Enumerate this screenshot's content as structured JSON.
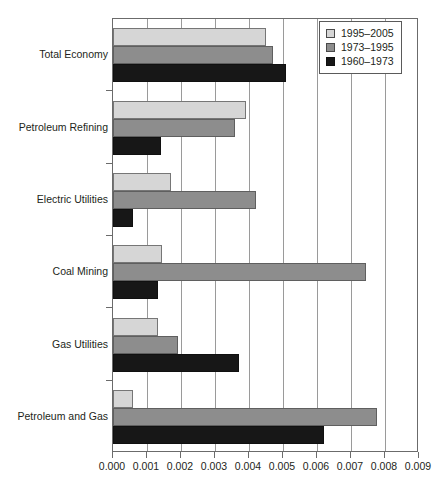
{
  "chart_data": {
    "type": "bar",
    "orientation": "horizontal",
    "title": "",
    "xlabel": "",
    "ylabel": "",
    "xlim": [
      0.0,
      0.009
    ],
    "xticks": [
      "0.000",
      "0.001",
      "0.002",
      "0.003",
      "0.004",
      "0.005",
      "0.006",
      "0.007",
      "0.008",
      "0.009"
    ],
    "xtick_values": [
      0.0,
      0.001,
      0.002,
      0.003,
      0.004,
      0.005,
      0.006,
      0.007,
      0.008,
      0.009
    ],
    "grid": "vertical",
    "legend_position": "top-right",
    "categories": [
      "Total Economy",
      "Petroleum Refining",
      "Electric Utilities",
      "Coal Mining",
      "Gas Utilities",
      "Petroleum and Gas"
    ],
    "series": [
      {
        "name": "1995–2005",
        "color": "#d6d6d6",
        "values": [
          0.0045,
          0.0039,
          0.00172,
          0.00143,
          0.00132,
          0.0006
        ]
      },
      {
        "name": "1973–1995",
        "color": "#8d8d8d",
        "values": [
          0.0047,
          0.0036,
          0.0042,
          0.00745,
          0.00192,
          0.00775
        ]
      },
      {
        "name": "1960–1973",
        "color": "#171717",
        "values": [
          0.0051,
          0.0014,
          0.00058,
          0.00132,
          0.00372,
          0.0062
        ]
      }
    ]
  },
  "legend": {
    "entries": [
      {
        "label": "1995–2005",
        "swatch": "light-gray-swatch"
      },
      {
        "label": "1973–1995",
        "swatch": "medium-gray-swatch"
      },
      {
        "label": "1960–1973",
        "swatch": "black-swatch"
      }
    ]
  }
}
